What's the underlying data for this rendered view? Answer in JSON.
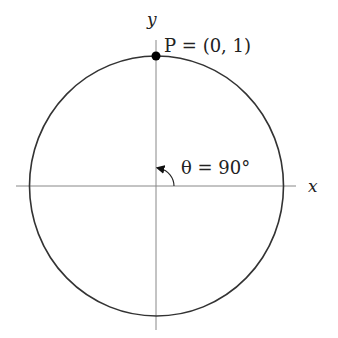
{
  "diagram": {
    "type": "unit-circle",
    "axes": {
      "x_label": "x",
      "y_label": "y"
    },
    "point": {
      "label": "P = (0, 1)",
      "name": "P",
      "coords": "(0, 1)"
    },
    "angle": {
      "label": "θ = 90°",
      "symbol": "θ",
      "value": "90°"
    },
    "colors": {
      "stroke": "#333333",
      "axis": "#888888",
      "point": "#000000"
    }
  }
}
